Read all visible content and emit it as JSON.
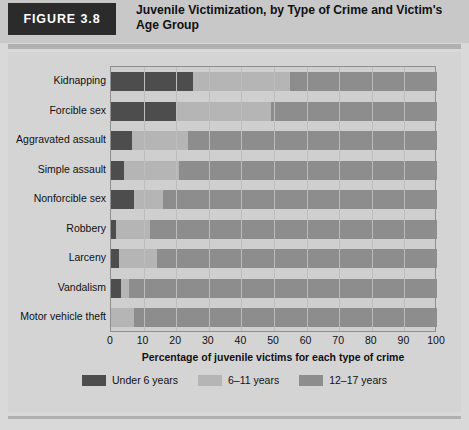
{
  "header": {
    "figure_tag": "FIGURE 3.8",
    "title": "Juvenile Victimization, by Type of Crime and Victim's Age Group"
  },
  "chart_data": {
    "type": "bar",
    "orientation": "horizontal",
    "stacked": "percent",
    "title": "Juvenile Victimization, by Type of Crime and Victim's Age Group",
    "xlabel": "Percentage of juvenile victims for each type of crime",
    "ylabel": "",
    "xlim": [
      0,
      100
    ],
    "xticks": [
      0,
      10,
      20,
      30,
      40,
      50,
      60,
      70,
      80,
      90,
      100
    ],
    "grid": true,
    "legend_position": "bottom",
    "categories": [
      "Kidnapping",
      "Forcible sex",
      "Aggravated assault",
      "Simple assault",
      "Nonforcible sex",
      "Robbery",
      "Larceny",
      "Vandalism",
      "Motor vehicle theft"
    ],
    "series": [
      {
        "name": "Under 6 years",
        "color": "#4d4d4d",
        "values": [
          25,
          20,
          6.5,
          4,
          7,
          1.5,
          2.5,
          3,
          0
        ]
      },
      {
        "name": "6–11 years",
        "color": "#b5b5b5",
        "values": [
          30,
          29,
          17,
          17,
          9,
          10.5,
          11.5,
          2.5,
          7
        ]
      },
      {
        "name": "12–17 years",
        "color": "#8d8d8d",
        "values": [
          45,
          51,
          76.5,
          79,
          84,
          88,
          86,
          94.5,
          93
        ]
      }
    ]
  },
  "legend": [
    {
      "label": "Under 6 years",
      "color": "#4d4d4d"
    },
    {
      "label": "6–11 years",
      "color": "#b5b5b5"
    },
    {
      "label": "12–17 years",
      "color": "#8d8d8d"
    }
  ]
}
